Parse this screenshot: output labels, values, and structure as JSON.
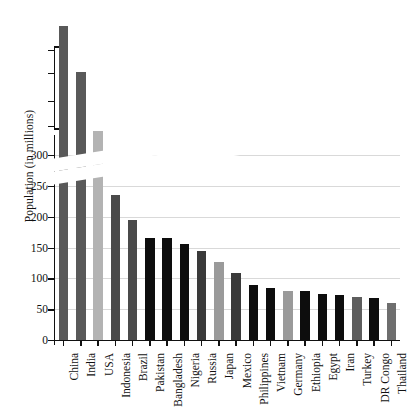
{
  "chart_data": {
    "type": "bar",
    "title": "",
    "xlabel": "",
    "ylabel": "Population (in millions)",
    "categories": [
      "China",
      "India",
      "USA",
      "Indonesia",
      "Brazil",
      "Pakistan",
      "Bangladesh",
      "Nigeria",
      "Russia",
      "Japan",
      "Mexico",
      "Philippines",
      "Vietnam",
      "Germany",
      "Ethiopia",
      "Egypt",
      "Iran",
      "Turkey",
      "DR Congo",
      "Thailand"
    ],
    "values": [
      1411,
      1380,
      311,
      235,
      195,
      166,
      165,
      155,
      144,
      127,
      109,
      90,
      85,
      80,
      79,
      75,
      73,
      69,
      68,
      60
    ],
    "bar_colors": [
      "#595959",
      "#595959",
      "#b3b3b3",
      "#4a4a4a",
      "#4a4a4a",
      "#0d0d0d",
      "#0d0d0d",
      "#0d0d0d",
      "#3a3a3a",
      "#9a9a9a",
      "#3a3a3a",
      "#0d0d0d",
      "#0d0d0d",
      "#9a9a9a",
      "#0d0d0d",
      "#0d0d0d",
      "#0d0d0d",
      "#5e5e5e",
      "#0d0d0d",
      "#6e6e6e"
    ],
    "ylim": [
      0,
      300
    ],
    "ytick_labels": [
      "0",
      "50",
      "100",
      "150",
      "200",
      "250",
      "300"
    ],
    "ytick_values": [
      0,
      50,
      100,
      150,
      200,
      250,
      300
    ],
    "upper_axis_tick_count": 4,
    "axis_break": true,
    "axis_break_note": "y-axis broken above 300; China and India bars continue above the break",
    "grid": true,
    "legend": false
  }
}
